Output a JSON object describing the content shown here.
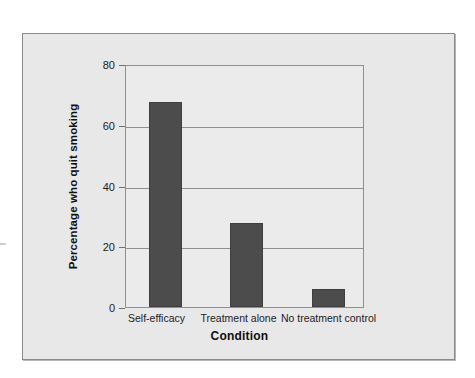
{
  "figure": {
    "background_color": "#e8e8e8",
    "border_color": "#8a8a8a"
  },
  "chart_data": {
    "type": "bar",
    "title": "",
    "subtitle": "",
    "xlabel": "Condition",
    "ylabel": "Percentage who quit smoking",
    "categories": [
      "Self-efficacy",
      "Treatment alone",
      "No treatment control"
    ],
    "values": [
      68,
      28,
      6
    ],
    "series": [
      {
        "name": "Percentage who quit smoking",
        "values": [
          68,
          28,
          6
        ]
      }
    ],
    "ylim": [
      0,
      80
    ],
    "yticks": [
      0,
      20,
      40,
      60,
      80
    ],
    "ytick_labels": [
      "0",
      "20",
      "40",
      "60",
      "80"
    ],
    "xlim_categories": 3,
    "grid": "horizontal",
    "legend": "none",
    "bar_color": "#4c4c4c",
    "plot_background": "#ebebeb",
    "axis_color": "#8f8f8f"
  },
  "axis": {
    "y": {
      "tick_0": "0",
      "tick_20": "20",
      "tick_40": "40",
      "tick_60": "60",
      "tick_80": "80",
      "title": "Percentage who quit smoking"
    },
    "x": {
      "cat_0": "Self-efficacy",
      "cat_1": "Treatment alone",
      "cat_2": "No treatment control",
      "title": "Condition"
    }
  }
}
